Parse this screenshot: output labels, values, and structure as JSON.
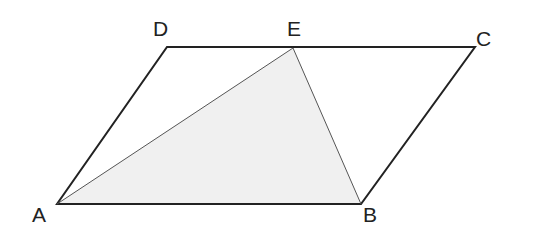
{
  "diagram": {
    "type": "parallelogram-with-inscribed-triangle",
    "colors": {
      "stroke": "#222222",
      "fill_triangle": "#f0f0f0",
      "background": "#ffffff"
    },
    "points": {
      "A": {
        "label": "A",
        "x": 57,
        "y": 204
      },
      "B": {
        "label": "B",
        "x": 361,
        "y": 204
      },
      "C": {
        "label": "C",
        "x": 475,
        "y": 47
      },
      "D": {
        "label": "D",
        "x": 167,
        "y": 47
      },
      "E": {
        "label": "E",
        "x": 293,
        "y": 48
      }
    },
    "labels": {
      "A": {
        "text": "A",
        "x": 32,
        "y": 222
      },
      "B": {
        "text": "B",
        "x": 363,
        "y": 222
      },
      "C": {
        "text": "C",
        "x": 476,
        "y": 46
      },
      "D": {
        "text": "D",
        "x": 153,
        "y": 36
      },
      "E": {
        "text": "E",
        "x": 287,
        "y": 36
      }
    },
    "shapes": {
      "parallelogram": "ABCD",
      "shaded_triangle": "ABE"
    }
  }
}
